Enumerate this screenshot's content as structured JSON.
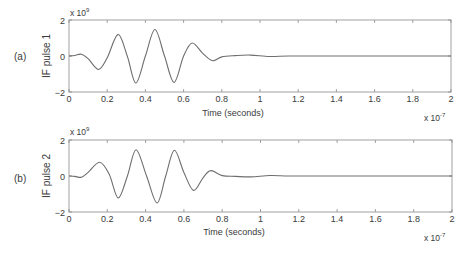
{
  "figure": {
    "panels": [
      {
        "panel_label": "(a)",
        "ylabel": "IF pulse 1",
        "xlabel": "Time (seconds)",
        "y_exponent": "x 10",
        "y_exponent_power": "9",
        "x_exponent": "x 10",
        "x_exponent_power": "-7",
        "yticks": [
          "2",
          "0",
          "−2"
        ],
        "xticks": [
          "0",
          "0.2",
          "0.4",
          "0.6",
          "0.8",
          "1",
          "1.2",
          "1.4",
          "1.6",
          "1.8",
          "2"
        ]
      },
      {
        "panel_label": "(b)",
        "ylabel": "IF pulse 2",
        "xlabel": "Time (seconds)",
        "y_exponent": "x 10",
        "y_exponent_power": "9",
        "x_exponent": "x 10",
        "x_exponent_power": "-7",
        "yticks": [
          "2",
          "0",
          "−2"
        ],
        "xticks": [
          "0",
          "0.2",
          "0.4",
          "0.6",
          "0.8",
          "1",
          "1.2",
          "1.4",
          "1.6",
          "1.8",
          "2"
        ]
      }
    ],
    "line_color": "#6e6e6e",
    "axes_color": "#8a8a8a"
  },
  "chart_data": [
    {
      "type": "line",
      "title": "",
      "panel": "(a)",
      "xlabel": "Time (seconds)",
      "ylabel": "IF pulse 1",
      "x_scale": "x 10^-7",
      "y_scale": "x 10^9",
      "xlim": [
        0,
        2
      ],
      "ylim": [
        -2,
        2
      ],
      "xticks": [
        0,
        0.2,
        0.4,
        0.6,
        0.8,
        1,
        1.2,
        1.4,
        1.6,
        1.8,
        2
      ],
      "yticks": [
        -2,
        0,
        2
      ],
      "grid": false,
      "series": [
        {
          "name": "IF pulse 1",
          "x": [
            0,
            0.03,
            0.065,
            0.1,
            0.155,
            0.2,
            0.257,
            0.305,
            0.35,
            0.4,
            0.45,
            0.5,
            0.55,
            0.6,
            0.645,
            0.7,
            0.75,
            0.8,
            0.87,
            0.95,
            1.05,
            1.15,
            1.3,
            1.5,
            1.7,
            2.0
          ],
          "y": [
            0,
            0.03,
            0.1,
            -0.15,
            -0.75,
            -0.1,
            1.2,
            0.0,
            -1.5,
            0.0,
            1.47,
            0.0,
            -1.47,
            0.0,
            0.72,
            0.15,
            -0.26,
            -0.05,
            0.02,
            0.05,
            -0.03,
            0.0,
            0.0,
            0.0,
            0.0,
            0.0
          ]
        }
      ]
    },
    {
      "type": "line",
      "title": "",
      "panel": "(b)",
      "xlabel": "Time (seconds)",
      "ylabel": "IF pulse 2",
      "x_scale": "x 10^-7",
      "y_scale": "x 10^9",
      "xlim": [
        0,
        2
      ],
      "ylim": [
        -2,
        2
      ],
      "xticks": [
        0,
        0.2,
        0.4,
        0.6,
        0.8,
        1,
        1.2,
        1.4,
        1.6,
        1.8,
        2
      ],
      "yticks": [
        -2,
        0,
        2
      ],
      "grid": false,
      "series": [
        {
          "name": "IF pulse 2",
          "x": [
            0,
            0.03,
            0.065,
            0.1,
            0.16,
            0.21,
            0.257,
            0.305,
            0.35,
            0.405,
            0.46,
            0.505,
            0.55,
            0.6,
            0.65,
            0.7,
            0.74,
            0.8,
            0.87,
            0.95,
            1.05,
            1.15,
            1.3,
            1.5,
            1.7,
            2.0
          ],
          "y": [
            0,
            -0.02,
            -0.07,
            0.2,
            0.76,
            0.1,
            -1.22,
            0.0,
            1.46,
            0.0,
            -1.5,
            0.0,
            1.43,
            0.2,
            -0.8,
            -0.1,
            0.3,
            0.02,
            -0.02,
            -0.05,
            0.03,
            0.0,
            0.0,
            0.0,
            0.0,
            0.0
          ]
        }
      ]
    }
  ]
}
